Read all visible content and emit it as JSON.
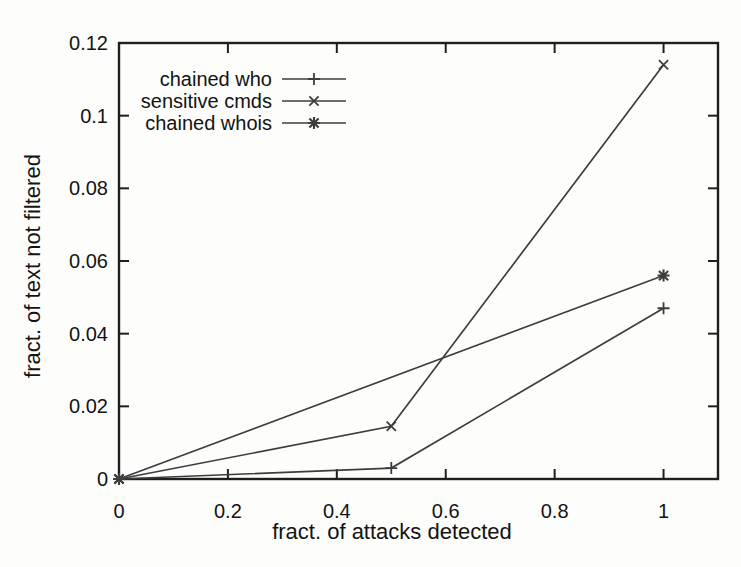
{
  "page": {
    "background": "#fdfdfc"
  },
  "chart_data": {
    "type": "line",
    "title": "",
    "xlabel": "fract. of attacks detected",
    "ylabel": "fract. of text not filtered",
    "xlim": [
      0,
      1.1
    ],
    "ylim": [
      0,
      0.12
    ],
    "xticks": {
      "values": [
        0,
        0.2,
        0.4,
        0.6,
        0.8,
        1
      ],
      "labels": [
        "0",
        "0.2",
        "0.4",
        "0.6",
        "0.8",
        "1"
      ]
    },
    "yticks": {
      "values": [
        0,
        0.02,
        0.04,
        0.06,
        0.08,
        0.1,
        0.12
      ],
      "labels": [
        "0",
        "0.02",
        "0.04",
        "0.06",
        "0.08",
        "0.1",
        "0.12"
      ]
    },
    "grid": false,
    "legend_position": "inside-top-left",
    "series": [
      {
        "name": "chained who",
        "marker": "plus",
        "x": [
          0,
          0.5,
          1
        ],
        "y": [
          0,
          0.003,
          0.047
        ]
      },
      {
        "name": "sensitive cmds",
        "marker": "cross",
        "x": [
          0,
          0.5,
          1
        ],
        "y": [
          0,
          0.0145,
          0.114
        ]
      },
      {
        "name": "chained whois",
        "marker": "asterisk",
        "x": [
          0,
          1
        ],
        "y": [
          0,
          0.056
        ]
      }
    ],
    "colors": {
      "line": "#3d3d3d",
      "frame": "#1f1f1f",
      "text": "#131313"
    }
  }
}
